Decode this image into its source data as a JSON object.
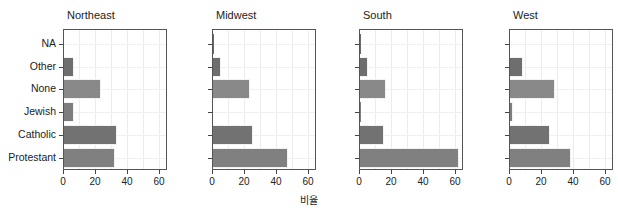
{
  "chart_data": {
    "type": "bar",
    "orientation": "horizontal",
    "title": "",
    "xlabel": "비율",
    "ylabel": "",
    "xlim": [
      0,
      65
    ],
    "xticks": [
      0,
      20,
      40,
      60
    ],
    "grid": true,
    "legend": null,
    "categories": [
      "NA",
      "Other",
      "None",
      "Jewish",
      "Catholic",
      "Protestant"
    ],
    "facets": [
      {
        "name": "Northeast",
        "values": [
          0,
          6,
          23,
          6,
          33,
          32
        ]
      },
      {
        "name": "Midwest",
        "values": [
          0.5,
          5,
          23,
          0,
          25,
          47
        ]
      },
      {
        "name": "South",
        "values": [
          0.5,
          5,
          16,
          0.5,
          15,
          62
        ]
      },
      {
        "name": "West",
        "values": [
          0,
          8,
          28,
          2,
          25,
          38
        ]
      }
    ],
    "colors": {
      "NA": "#6a6a6a",
      "Other": "#6e6e6e",
      "None": "#898989",
      "Jewish": "#7e7e7e",
      "Catholic": "#727272",
      "Protestant": "#808080"
    }
  },
  "labels": {
    "xaxis_title": "비율",
    "categories": [
      "NA",
      "Other",
      "None",
      "Jewish",
      "Catholic",
      "Protestant"
    ],
    "xticks": [
      "0",
      "20",
      "40",
      "60"
    ],
    "panels": [
      "Northeast",
      "Midwest",
      "South",
      "West"
    ]
  }
}
